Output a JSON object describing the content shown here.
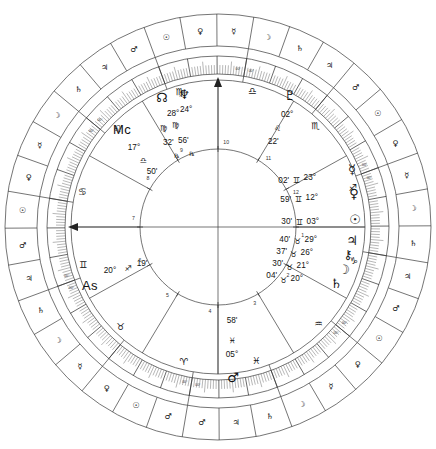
{
  "chart": {
    "type": "astrological-wheel",
    "house_system_labels": [
      "1",
      "2",
      "3",
      "4",
      "5",
      "6",
      "7",
      "8",
      "9",
      "10",
      "11",
      "12"
    ],
    "cusp_degree_label": "00°",
    "retrograde_symbol": "℞"
  },
  "zodiac_signs": [
    {
      "name": "Aries",
      "glyph": "♈"
    },
    {
      "name": "Taurus",
      "glyph": "♉"
    },
    {
      "name": "Gemini",
      "glyph": "♊"
    },
    {
      "name": "Cancer",
      "glyph": "♋"
    },
    {
      "name": "Leo",
      "glyph": "♌"
    },
    {
      "name": "Virgo",
      "glyph": "♍"
    },
    {
      "name": "Libra",
      "glyph": "♎"
    },
    {
      "name": "Scorpio",
      "glyph": "♏"
    },
    {
      "name": "Sagittarius",
      "glyph": "♐"
    },
    {
      "name": "Capricorn",
      "glyph": "♑"
    },
    {
      "name": "Aquarius",
      "glyph": "♒"
    },
    {
      "name": "Pisces",
      "glyph": "♓"
    }
  ],
  "decan_rulers": [
    {
      "sign": "Aries",
      "rulers": [
        "♂",
        "☉",
        "♀"
      ]
    },
    {
      "sign": "Taurus",
      "rulers": [
        "☿",
        "☽",
        "♄"
      ]
    },
    {
      "sign": "Gemini",
      "rulers": [
        "♃",
        "♂",
        "☉"
      ]
    },
    {
      "sign": "Cancer",
      "rulers": [
        "♀",
        "☿",
        "☽"
      ]
    },
    {
      "sign": "Leo",
      "rulers": [
        "♄",
        "♃",
        "♂"
      ]
    },
    {
      "sign": "Virgo",
      "rulers": [
        "☉",
        "♀",
        "☿"
      ]
    },
    {
      "sign": "Libra",
      "rulers": [
        "☽",
        "♄",
        "♃"
      ]
    },
    {
      "sign": "Scorpio",
      "rulers": [
        "♂",
        "☉",
        "♀"
      ]
    },
    {
      "sign": "Sagittarius",
      "rulers": [
        "☿",
        "☽",
        "♄"
      ]
    },
    {
      "sign": "Capricorn",
      "rulers": [
        "♃",
        "♂",
        "☉"
      ]
    },
    {
      "sign": "Aquarius",
      "rulers": [
        "♀",
        "☿",
        "☽"
      ]
    },
    {
      "sign": "Pisces",
      "rulers": [
        "♄",
        "♃",
        "♂"
      ]
    }
  ],
  "axes": [
    {
      "name": "Midheaven",
      "abbr": "Mc",
      "degree": "17°",
      "sign_glyph": "♎",
      "sign": "Libra",
      "minute": "50'"
    },
    {
      "name": "Ascendant",
      "abbr": "As",
      "degree": "20°",
      "sign_glyph": "♐",
      "sign": "Sagittarius",
      "minute": "19'"
    }
  ],
  "planets": [
    {
      "name": "North Node",
      "glyph": "☊",
      "degree": "24°",
      "sign_glyph": "♍",
      "sign": "Virgo",
      "minute": "56'",
      "retrograde": true
    },
    {
      "name": "Neptune",
      "glyph": "♆",
      "degree": "28°",
      "sign_glyph": "♍",
      "sign": "Virgo",
      "minute": "32'",
      "retrograde": true
    },
    {
      "name": "Pluto",
      "glyph": "♇",
      "degree": "02°",
      "sign_glyph": "♌",
      "sign": "Leo",
      "minute": "22'",
      "retrograde": false
    },
    {
      "name": "Mercury",
      "glyph": "☿",
      "degree": "23°",
      "sign_glyph": "♊",
      "sign": "Gemini",
      "minute": "02'",
      "retrograde": false
    },
    {
      "name": "Venus",
      "glyph": "♀",
      "degree": "12°",
      "sign_glyph": "♊",
      "sign": "Gemini",
      "minute": "59'",
      "retrograde": false
    },
    {
      "name": "Sun",
      "glyph": "☉",
      "degree": "03°",
      "sign_glyph": "♊",
      "sign": "Gemini",
      "minute": "30'",
      "retrograde": false
    },
    {
      "name": "Jupiter",
      "glyph": "♃",
      "degree": "29°",
      "sign_glyph": "♉",
      "sign": "Taurus",
      "minute": "40'",
      "retrograde": false
    },
    {
      "name": "Chiron",
      "glyph": "⚷",
      "degree": "26°",
      "sign_glyph": "♉",
      "sign": "Taurus",
      "minute": "37'",
      "retrograde": false
    },
    {
      "name": "Moon",
      "glyph": "☽",
      "degree": "21°",
      "sign_glyph": "♉",
      "sign": "Taurus",
      "minute": "30'",
      "retrograde": false
    },
    {
      "name": "Saturn",
      "glyph": "♄",
      "degree": "20°",
      "sign_glyph": "♉",
      "sign": "Taurus",
      "minute": "04'",
      "retrograde": false
    },
    {
      "name": "Mars",
      "glyph": "♂",
      "degree": "05°",
      "sign_glyph": "♓",
      "sign": "Pisces",
      "minute": "58'",
      "retrograde": false
    }
  ],
  "colors": {
    "line": "#3a3a3a",
    "text": "#111111",
    "background": "#ffffff"
  }
}
